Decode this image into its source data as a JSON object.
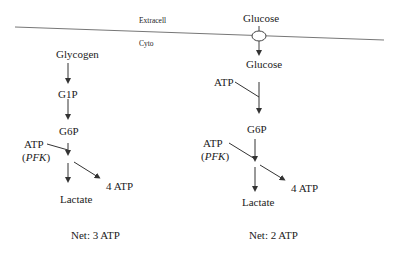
{
  "regions": {
    "extracellular": "Extracell",
    "cytoplasm": "Cyto"
  },
  "left_pathway": {
    "start": "Glycogen",
    "step1": "G1P",
    "step2": "G6P",
    "atp_input": "ATP",
    "enzyme": "PFK",
    "atp_output": "4 ATP",
    "end": "Lactate",
    "net": "Net: 3 ATP"
  },
  "right_pathway": {
    "start_extracellular": "Glucose",
    "start_intracellular": "Glucose",
    "atp_input_hexokinase": "ATP",
    "step1": "G6P",
    "atp_input": "ATP",
    "enzyme": "PFK",
    "atp_output": "4 ATP",
    "end": "Lactate",
    "net": "Net: 2 ATP"
  },
  "colors": {
    "line": "#444444",
    "membrane": "#777777",
    "text": "#222222"
  }
}
